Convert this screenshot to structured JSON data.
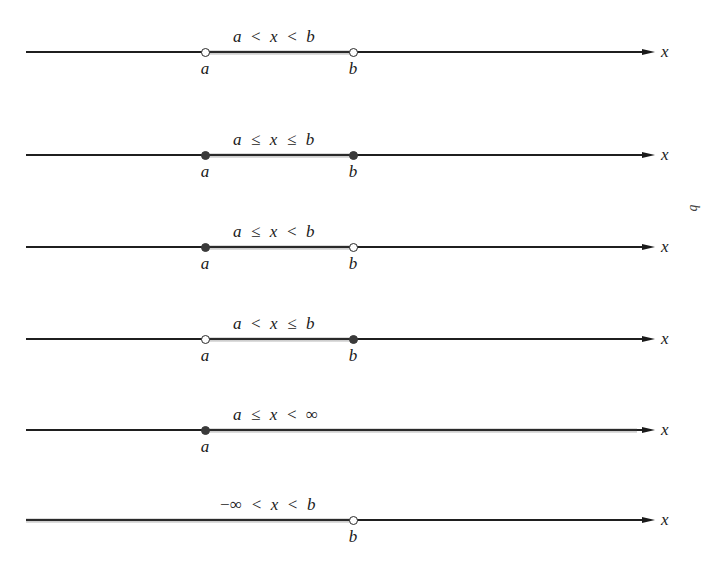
{
  "diagram": {
    "axis_variable": "x",
    "line_x_start": 26,
    "arrow_tip_x": 655,
    "axis_label_x": 661,
    "point_a_x": 205,
    "point_b_x": 353,
    "margin_artifact": "b",
    "rows": [
      {
        "y": 52,
        "inequality": "a < x < b",
        "inequality_tokens": [
          "a",
          "<",
          "x",
          "<",
          "b"
        ],
        "left": {
          "type": "open",
          "label": "a",
          "at": "a"
        },
        "right": {
          "type": "open",
          "label": "b",
          "at": "b"
        },
        "shade_from": "a",
        "shade_to": "b"
      },
      {
        "y": 155,
        "inequality": "a ≤ x ≤ b",
        "inequality_tokens": [
          "a",
          "≤",
          "x",
          "≤",
          "b"
        ],
        "left": {
          "type": "closed",
          "label": "a",
          "at": "a"
        },
        "right": {
          "type": "closed",
          "label": "b",
          "at": "b"
        },
        "shade_from": "a",
        "shade_to": "b"
      },
      {
        "y": 247,
        "inequality": "a ≤ x < b",
        "inequality_tokens": [
          "a",
          "≤",
          "x",
          "<",
          "b"
        ],
        "left": {
          "type": "closed",
          "label": "a",
          "at": "a"
        },
        "right": {
          "type": "open",
          "label": "b",
          "at": "b"
        },
        "shade_from": "a",
        "shade_to": "b"
      },
      {
        "y": 339,
        "inequality": "a < x ≤ b",
        "inequality_tokens": [
          "a",
          "<",
          "x",
          "≤",
          "b"
        ],
        "left": {
          "type": "open",
          "label": "a",
          "at": "a"
        },
        "right": {
          "type": "closed",
          "label": "b",
          "at": "b"
        },
        "shade_from": "a",
        "shade_to": "b"
      },
      {
        "y": 430,
        "inequality": "a ≤ x < ∞",
        "inequality_tokens": [
          "a",
          "≤",
          "x",
          "<",
          "∞"
        ],
        "left": {
          "type": "closed",
          "label": "a",
          "at": "a"
        },
        "right": null,
        "shade_from": "a",
        "shade_to": "+inf"
      },
      {
        "y": 520,
        "inequality": "−∞ < x < b",
        "inequality_tokens": [
          "−∞",
          "<",
          "x",
          "<",
          "b"
        ],
        "left": null,
        "right": {
          "type": "open",
          "label": "b",
          "at": "b"
        },
        "shade_from": "-inf",
        "shade_to": "b"
      }
    ]
  }
}
